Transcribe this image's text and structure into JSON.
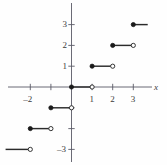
{
  "chart_data": {
    "type": "line",
    "title": "",
    "xlabel": "x",
    "ylabel": "",
    "xlim": [
      -3.1,
      3.6
    ],
    "ylim": [
      -3.6,
      3.4
    ],
    "grid": false,
    "legend": null,
    "x_ticks": [
      {
        "value": -2,
        "label": "–2"
      },
      {
        "value": -1,
        "label": ""
      },
      {
        "value": 1,
        "label": "1"
      },
      {
        "value": 2,
        "label": "2"
      },
      {
        "value": 3,
        "label": "3"
      }
    ],
    "y_ticks": [
      {
        "value": 3,
        "label": "3"
      },
      {
        "value": 2,
        "label": "2"
      },
      {
        "value": 1,
        "label": "1"
      },
      {
        "value": -1,
        "label": ""
      },
      {
        "value": -2,
        "label": ""
      },
      {
        "value": -3,
        "label": "–3"
      }
    ],
    "segments": [
      {
        "x_start": -3.2,
        "x_end": -2.0,
        "y": -3,
        "left_endpoint": "none",
        "right_endpoint": "open"
      },
      {
        "x_start": -2.0,
        "x_end": -1.0,
        "y": -2,
        "left_endpoint": "closed",
        "right_endpoint": "open"
      },
      {
        "x_start": -1.0,
        "x_end": 0.0,
        "y": -1,
        "left_endpoint": "closed",
        "right_endpoint": "open"
      },
      {
        "x_start": 0.0,
        "x_end": 1.0,
        "y": 0,
        "left_endpoint": "closed",
        "right_endpoint": "open"
      },
      {
        "x_start": 1.0,
        "x_end": 2.0,
        "y": 1,
        "left_endpoint": "closed",
        "right_endpoint": "open"
      },
      {
        "x_start": 2.0,
        "x_end": 3.0,
        "y": 2,
        "left_endpoint": "closed",
        "right_endpoint": "open"
      },
      {
        "x_start": 3.0,
        "x_end": 3.7,
        "y": 3,
        "left_endpoint": "closed",
        "right_endpoint": "none"
      }
    ],
    "colors": {
      "axis": "#5a5a66",
      "curve": "#2b2b2b",
      "marker_fill": "#1a1a1a",
      "marker_open": "#ffffff",
      "text": "#3a3a3a",
      "background": "#fefefe"
    }
  }
}
